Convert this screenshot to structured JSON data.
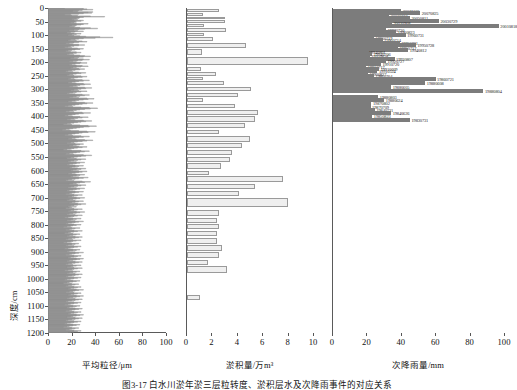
{
  "figure": {
    "caption": "图3-17  白水川淤年淤三层粒转度、淤积层水及次降雨事件的对应关系",
    "y_axis_label": "深度/cm",
    "y_ticks": [
      0,
      50,
      100,
      150,
      200,
      250,
      300,
      350,
      400,
      450,
      500,
      550,
      600,
      650,
      700,
      750,
      800,
      850,
      900,
      950,
      1000,
      1050,
      1100,
      1150,
      1200
    ],
    "y_range": [
      0,
      1200
    ]
  },
  "chart_data": [
    {
      "type": "line",
      "title": "平均粒径",
      "xlabel": "平均粒径/μm",
      "ylabel": "深度/cm",
      "xlim": [
        0,
        100
      ],
      "ylim": [
        0,
        1200
      ],
      "x_ticks": [
        0,
        20,
        40,
        60,
        80,
        100
      ],
      "grid": false,
      "orientation": "horizontal-step-profile",
      "x": [
        14,
        30,
        33,
        38,
        29,
        26,
        21,
        25,
        38,
        34,
        37,
        30,
        26,
        19,
        14,
        20,
        25,
        36,
        48,
        30,
        27,
        26,
        24,
        20,
        25,
        22,
        30,
        28,
        23,
        24,
        22,
        19,
        24,
        34,
        30,
        28,
        24,
        20,
        23,
        18,
        22,
        27,
        36,
        42,
        31,
        26,
        22,
        18,
        25,
        30,
        23,
        19,
        16,
        22,
        28,
        24,
        20,
        17,
        22,
        27,
        32,
        44,
        55,
        40,
        30,
        26,
        23,
        19,
        17,
        24,
        29,
        33,
        26,
        22,
        18,
        15,
        21,
        26,
        31,
        26,
        22,
        19,
        17,
        14,
        20,
        25,
        30,
        27,
        23,
        20,
        17,
        15,
        19,
        24,
        28,
        24,
        21,
        18,
        16,
        22,
        27,
        31,
        36,
        30,
        26,
        22,
        19,
        25,
        30,
        35,
        29,
        25,
        21,
        18,
        24,
        28,
        33,
        27,
        23,
        20,
        18,
        24,
        29,
        34,
        28,
        24,
        21,
        19,
        26,
        31,
        27,
        23,
        20,
        17,
        15,
        21,
        26,
        32,
        28,
        24,
        21,
        18,
        16,
        22,
        28,
        33,
        29,
        25,
        22,
        19,
        17,
        23,
        29,
        35,
        30,
        26,
        23,
        20,
        17,
        24,
        30,
        36,
        31,
        27,
        24,
        21,
        18,
        25,
        31,
        37,
        32,
        28,
        25,
        22,
        19,
        26,
        33,
        28,
        24,
        21,
        18,
        16,
        23,
        29,
        35,
        31,
        27,
        24,
        21,
        18,
        26,
        33,
        39,
        34,
        30,
        26,
        23,
        20,
        17,
        24,
        31,
        38,
        33,
        29,
        26,
        23,
        20,
        17,
        14,
        21,
        28,
        35,
        42,
        36,
        31,
        27,
        24,
        21,
        18,
        15,
        22,
        29,
        36,
        30,
        26,
        23,
        20,
        17,
        14,
        21,
        27,
        34,
        29,
        25,
        22,
        19,
        16,
        23,
        30,
        37,
        32,
        28,
        25,
        22,
        19,
        16,
        13,
        20,
        27,
        34,
        41,
        35,
        30,
        27,
        24,
        21,
        18,
        15,
        12,
        19,
        26,
        33,
        40,
        34,
        29,
        26,
        23,
        20,
        17,
        14,
        21,
        28,
        35,
        30,
        26,
        23,
        20,
        17,
        24,
        31,
        38,
        33,
        29,
        25,
        22,
        19,
        16,
        23,
        30,
        27,
        24,
        21,
        18,
        26,
        33,
        29,
        25,
        22,
        19,
        16,
        13,
        20,
        28,
        35,
        31,
        27,
        24,
        21,
        18,
        15,
        22,
        30,
        37,
        32,
        28,
        25,
        22,
        19,
        16,
        24,
        32,
        28,
        25,
        22,
        19,
        17,
        24,
        31,
        27,
        24,
        21,
        18,
        16,
        23,
        30,
        26,
        23,
        20,
        18,
        25,
        32,
        28,
        24,
        21,
        19,
        26,
        33,
        29,
        26,
        23,
        20,
        17,
        24,
        31,
        27,
        24,
        21,
        19,
        26,
        34,
        30,
        26,
        23,
        20,
        17,
        15,
        22,
        29,
        36,
        31,
        27,
        24,
        21,
        18,
        25,
        32,
        28,
        25,
        22,
        19,
        17,
        24,
        31,
        27,
        24,
        21,
        18,
        16,
        23,
        30,
        26,
        23,
        20,
        18,
        15,
        22,
        29,
        25,
        22,
        20,
        17,
        24,
        31,
        27,
        24,
        21,
        18,
        16,
        23,
        30,
        26,
        23,
        20,
        18,
        25,
        32,
        28,
        25,
        22,
        19,
        17,
        24,
        20,
        18,
        15,
        22,
        29,
        25,
        22,
        19,
        17,
        24,
        31,
        27,
        24,
        21,
        18,
        16,
        23,
        29,
        25,
        22,
        19,
        17,
        14,
        21,
        28,
        24,
        21,
        19,
        16,
        23,
        30,
        26,
        23,
        20,
        17,
        15,
        22,
        28,
        24,
        21,
        19,
        16,
        13,
        20,
        27,
        23,
        20,
        18,
        15,
        22,
        29,
        25,
        22,
        19,
        17,
        14,
        21,
        27,
        24,
        21,
        18,
        16,
        23,
        29,
        26,
        23,
        20,
        17,
        15,
        21,
        28,
        24,
        21,
        19,
        16,
        13,
        20,
        26,
        23,
        20,
        17,
        15,
        22,
        28,
        25,
        22,
        19,
        17,
        14,
        21,
        27,
        24,
        21,
        18,
        16,
        23,
        30,
        26,
        23,
        20,
        18,
        15,
        22,
        28,
        25,
        22,
        19,
        17,
        24,
        30,
        27,
        24,
        21,
        18,
        16,
        23,
        29,
        26,
        23,
        20,
        17,
        15,
        21,
        28,
        24,
        21,
        19,
        16,
        22,
        29,
        25,
        22,
        20,
        17,
        14,
        21,
        27,
        24,
        21,
        18,
        16,
        23,
        29,
        26,
        23,
        20,
        17,
        15,
        22,
        28,
        25,
        22,
        19,
        16,
        14,
        21,
        27,
        24,
        21,
        18,
        16,
        13,
        20,
        26,
        23,
        20,
        17,
        15,
        22,
        28,
        25,
        22,
        19,
        17,
        24,
        30,
        26,
        23,
        21,
        18,
        15,
        22,
        28,
        25,
        22,
        19,
        17,
        24,
        30,
        27,
        24,
        21,
        18,
        16,
        23,
        29,
        26,
        23,
        20,
        17,
        15,
        22,
        28,
        25,
        22,
        19,
        17,
        14,
        21,
        27,
        24,
        21,
        18,
        16,
        23,
        29,
        26,
        23,
        20,
        18,
        15,
        22,
        28,
        25,
        22,
        19,
        17,
        24,
        30,
        27,
        24,
        21,
        19,
        16,
        23,
        29,
        26,
        23,
        20,
        17,
        15,
        22,
        28,
        25,
        22,
        19,
        16,
        14,
        21,
        27,
        24,
        21,
        18,
        16,
        13,
        20,
        26,
        23,
        20,
        18,
        15,
        22,
        28,
        25,
        22,
        19,
        17
      ],
      "note": "step profile of mean grain size plotted against depth; values in micrometres"
    },
    {
      "type": "bar",
      "title": "淤积量",
      "xlabel": "淤积量/万m³",
      "ylabel": "深度/cm",
      "xlim": [
        0,
        10
      ],
      "ylim": [
        0,
        1200
      ],
      "x_ticks": [
        0,
        2,
        4,
        6,
        8,
        10
      ],
      "grid": false,
      "orientation": "horizontal",
      "bars": [
        {
          "depth_top": 4,
          "depth_bottom": 17,
          "value": 2.55
        },
        {
          "depth_top": 19,
          "depth_bottom": 30,
          "value": 1.3
        },
        {
          "depth_top": 32,
          "depth_bottom": 44,
          "value": 3.05
        },
        {
          "depth_top": 46,
          "depth_bottom": 58,
          "value": 3.0
        },
        {
          "depth_top": 60,
          "depth_bottom": 72,
          "value": 1.35
        },
        {
          "depth_top": 74,
          "depth_bottom": 90,
          "value": 3.1
        },
        {
          "depth_top": 92,
          "depth_bottom": 106,
          "value": 1.35
        },
        {
          "depth_top": 108,
          "depth_bottom": 126,
          "value": 2.05
        },
        {
          "depth_top": 128,
          "depth_bottom": 150,
          "value": 4.7
        },
        {
          "depth_top": 152,
          "depth_bottom": 178,
          "value": 1.2
        },
        {
          "depth_top": 180,
          "depth_bottom": 215,
          "value": 9.6
        },
        {
          "depth_top": 218,
          "depth_bottom": 236,
          "value": 1.1
        },
        {
          "depth_top": 238,
          "depth_bottom": 252,
          "value": 2.3
        },
        {
          "depth_top": 254,
          "depth_bottom": 268,
          "value": 1.25
        },
        {
          "depth_top": 270,
          "depth_bottom": 288,
          "value": 2.9
        },
        {
          "depth_top": 290,
          "depth_bottom": 310,
          "value": 5.1
        },
        {
          "depth_top": 312,
          "depth_bottom": 332,
          "value": 4.05
        },
        {
          "depth_top": 334,
          "depth_bottom": 352,
          "value": 1.3
        },
        {
          "depth_top": 354,
          "depth_bottom": 374,
          "value": 3.8
        },
        {
          "depth_top": 376,
          "depth_bottom": 398,
          "value": 5.6
        },
        {
          "depth_top": 400,
          "depth_bottom": 424,
          "value": 5.4
        },
        {
          "depth_top": 426,
          "depth_bottom": 448,
          "value": 4.6
        },
        {
          "depth_top": 450,
          "depth_bottom": 470,
          "value": 2.55
        },
        {
          "depth_top": 472,
          "depth_bottom": 498,
          "value": 5.0
        },
        {
          "depth_top": 500,
          "depth_bottom": 522,
          "value": 4.35
        },
        {
          "depth_top": 524,
          "depth_bottom": 548,
          "value": 3.6
        },
        {
          "depth_top": 550,
          "depth_bottom": 572,
          "value": 3.45
        },
        {
          "depth_top": 574,
          "depth_bottom": 598,
          "value": 2.7
        },
        {
          "depth_top": 600,
          "depth_bottom": 618,
          "value": 1.75
        },
        {
          "depth_top": 620,
          "depth_bottom": 646,
          "value": 7.6
        },
        {
          "depth_top": 648,
          "depth_bottom": 672,
          "value": 5.4
        },
        {
          "depth_top": 674,
          "depth_bottom": 700,
          "value": 4.1
        },
        {
          "depth_top": 702,
          "depth_bottom": 744,
          "value": 8.05
        },
        {
          "depth_top": 746,
          "depth_bottom": 772,
          "value": 2.55
        },
        {
          "depth_top": 774,
          "depth_bottom": 796,
          "value": 2.4
        },
        {
          "depth_top": 798,
          "depth_bottom": 822,
          "value": 2.5
        },
        {
          "depth_top": 824,
          "depth_bottom": 848,
          "value": 2.4
        },
        {
          "depth_top": 850,
          "depth_bottom": 874,
          "value": 2.35
        },
        {
          "depth_top": 876,
          "depth_bottom": 900,
          "value": 2.8
        },
        {
          "depth_top": 902,
          "depth_bottom": 928,
          "value": 2.55
        },
        {
          "depth_top": 930,
          "depth_bottom": 952,
          "value": 1.7
        },
        {
          "depth_top": 954,
          "depth_bottom": 986,
          "value": 3.2
        },
        {
          "depth_top": 1060,
          "depth_bottom": 1082,
          "value": 1.0
        }
      ]
    },
    {
      "type": "bar",
      "title": "次降雨量",
      "xlabel": "次降雨量/mm",
      "ylabel": "深度/cm",
      "xlim": [
        0,
        100
      ],
      "ylim": [
        0,
        1200
      ],
      "x_ticks": [
        0,
        20,
        40,
        60,
        80,
        100
      ],
      "grid": false,
      "orientation": "horizontal",
      "bars": [
        {
          "depth": 10,
          "value": 40.0,
          "label": "20071005"
        },
        {
          "depth": 20,
          "value": 51.0,
          "label": "20070825"
        },
        {
          "depth": 29,
          "value": 33.0,
          "label": "20060812"
        },
        {
          "depth": 38,
          "value": 45.0,
          "label": "20050811"
        },
        {
          "depth": 48,
          "value": 62.0,
          "label": "20030729"
        },
        {
          "depth": 57,
          "value": 34.5,
          "label": "20020908"
        },
        {
          "depth": 68,
          "value": 97.0,
          "label": "20010818"
        },
        {
          "depth": 80,
          "value": 31.0,
          "label": "19970730"
        },
        {
          "depth": 90,
          "value": 37.0,
          "label": "19960823"
        },
        {
          "depth": 100,
          "value": 42.5,
          "label": "19960731"
        },
        {
          "depth": 109,
          "value": 24.0,
          "label": "19960719"
        },
        {
          "depth": 118,
          "value": 29.0,
          "label": "19960714"
        },
        {
          "depth": 128,
          "value": 39.0,
          "label": "19950831"
        },
        {
          "depth": 137,
          "value": 48.5,
          "label": "19950728"
        },
        {
          "depth": 146,
          "value": 38.0,
          "label": "19950717"
        },
        {
          "depth": 156,
          "value": 44.0,
          "label": "19940812"
        },
        {
          "depth": 164,
          "value": 20.0,
          "label": "19940801"
        },
        {
          "depth": 171,
          "value": 23.0,
          "label": "19940706"
        },
        {
          "depth": 178,
          "value": 21.5,
          "label": "19920828"
        },
        {
          "depth": 187,
          "value": 36.0,
          "label": "19920807"
        },
        {
          "depth": 197,
          "value": 31.0,
          "label": "19920727"
        },
        {
          "depth": 207,
          "value": 28.0,
          "label": "19910720"
        },
        {
          "depth": 216,
          "value": 19.5,
          "label": "19910717"
        },
        {
          "depth": 225,
          "value": 27.0,
          "label": "19910609"
        },
        {
          "depth": 234,
          "value": 26.0,
          "label": "19910524"
        },
        {
          "depth": 242,
          "value": 20.5,
          "label": "19900827"
        },
        {
          "depth": 251,
          "value": 24.0,
          "label": "19860704"
        },
        {
          "depth": 263,
          "value": 60.0,
          "label": "19860721"
        },
        {
          "depth": 277,
          "value": 54.0,
          "label": "19880608"
        },
        {
          "depth": 290,
          "value": 34.0,
          "label": "19880605"
        },
        {
          "depth": 307,
          "value": 88.0,
          "label": "19880804"
        },
        {
          "depth": 327,
          "value": 26.5,
          "label": "19880803"
        },
        {
          "depth": 340,
          "value": 30.0,
          "label": "19880624"
        },
        {
          "depth": 352,
          "value": 22.5,
          "label": "19870802"
        },
        {
          "depth": 364,
          "value": 22.0,
          "label": "19870709"
        },
        {
          "depth": 376,
          "value": 24.5,
          "label": "19840721"
        },
        {
          "depth": 388,
          "value": 34.0,
          "label": "19840626"
        },
        {
          "depth": 400,
          "value": 23.0,
          "label": "19850823"
        },
        {
          "depth": 414,
          "value": 45.0,
          "label": "19830731"
        }
      ],
      "note": "depth values listed as pixel-row order keys; label is event date YYYYMMDD"
    }
  ]
}
